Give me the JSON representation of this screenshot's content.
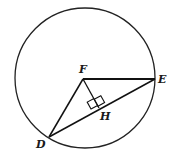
{
  "diagram": {
    "title": "",
    "circle": {
      "cx": 85,
      "cy": 78,
      "r": 70,
      "stroke": "#222222"
    },
    "points": {
      "F": {
        "label": "F",
        "x": 83,
        "y": 79
      },
      "E": {
        "label": "E",
        "x": 155,
        "y": 79
      },
      "D": {
        "label": "D",
        "x": 49,
        "y": 137
      },
      "H": {
        "label": "H",
        "x": 99,
        "y": 108
      }
    },
    "segments": [
      "FE",
      "FD",
      "DE",
      "FH"
    ],
    "annotations": [
      {
        "type": "right-angle",
        "at": "H",
        "between": [
          "FH",
          "DE"
        ]
      }
    ]
  }
}
